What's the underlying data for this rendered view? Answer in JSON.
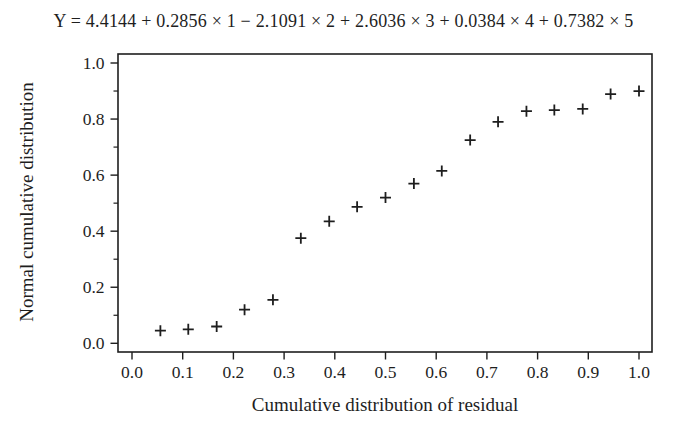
{
  "colors": {
    "ink": "#1e1e1e",
    "background": "#ffffff"
  },
  "chart_data": {
    "type": "scatter",
    "title": "Y = 4.4144 + 0.2856 × 1 − 2.1091 × 2 + 2.6036 × 3 + 0.0384 × 4 + 0.7382 × 5",
    "xlabel": "Cumulative distribution of residual",
    "ylabel": "Normal cumulative distribution",
    "xlim": [
      0.0,
      1.0
    ],
    "ylim": [
      0.0,
      1.0
    ],
    "grid": false,
    "legend_position": "none",
    "marker": "plus",
    "x_ticks": [
      0.0,
      0.1,
      0.2,
      0.3,
      0.4,
      0.5,
      0.6,
      0.7,
      0.8,
      0.9,
      1.0
    ],
    "x_tick_labels": [
      "0.0",
      "0.1",
      "0.2",
      "0.3",
      "0.4",
      "0.5",
      "0.6",
      "0.7",
      "0.8",
      "0.9",
      "1.0"
    ],
    "y_ticks_major": [
      0.0,
      0.2,
      0.4,
      0.6,
      0.8,
      1.0
    ],
    "y_tick_labels": [
      "0.0",
      "0.2",
      "0.4",
      "0.6",
      "0.8",
      "1.0"
    ],
    "y_ticks_minor": [
      0.1,
      0.3,
      0.5,
      0.7,
      0.9
    ],
    "points": [
      [
        0.056,
        0.045
      ],
      [
        0.111,
        0.05
      ],
      [
        0.167,
        0.06
      ],
      [
        0.222,
        0.12
      ],
      [
        0.278,
        0.155
      ],
      [
        0.333,
        0.375
      ],
      [
        0.389,
        0.435
      ],
      [
        0.444,
        0.487
      ],
      [
        0.5,
        0.52
      ],
      [
        0.556,
        0.57
      ],
      [
        0.611,
        0.615
      ],
      [
        0.667,
        0.725
      ],
      [
        0.722,
        0.79
      ],
      [
        0.778,
        0.828
      ],
      [
        0.833,
        0.832
      ],
      [
        0.889,
        0.836
      ],
      [
        0.944,
        0.889
      ],
      [
        1.0,
        0.9
      ]
    ]
  }
}
